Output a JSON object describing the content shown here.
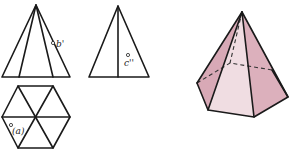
{
  "figure": {
    "front_view": {
      "name": "front-view",
      "label": "b'"
    },
    "side_view": {
      "name": "side-view",
      "label": "c''"
    },
    "top_view": {
      "name": "top-view",
      "label": "(a)"
    },
    "solid": {
      "name": "hexagonal-pyramid-3d"
    }
  },
  "colors": {
    "line": "#1a1a1a",
    "face_left": "#d8a9b6",
    "face_front": "#f0dde2",
    "face_right": "#dcb0bc",
    "face_back_left": "#e8c8d1",
    "face_back_right": "#e4c0ca"
  }
}
